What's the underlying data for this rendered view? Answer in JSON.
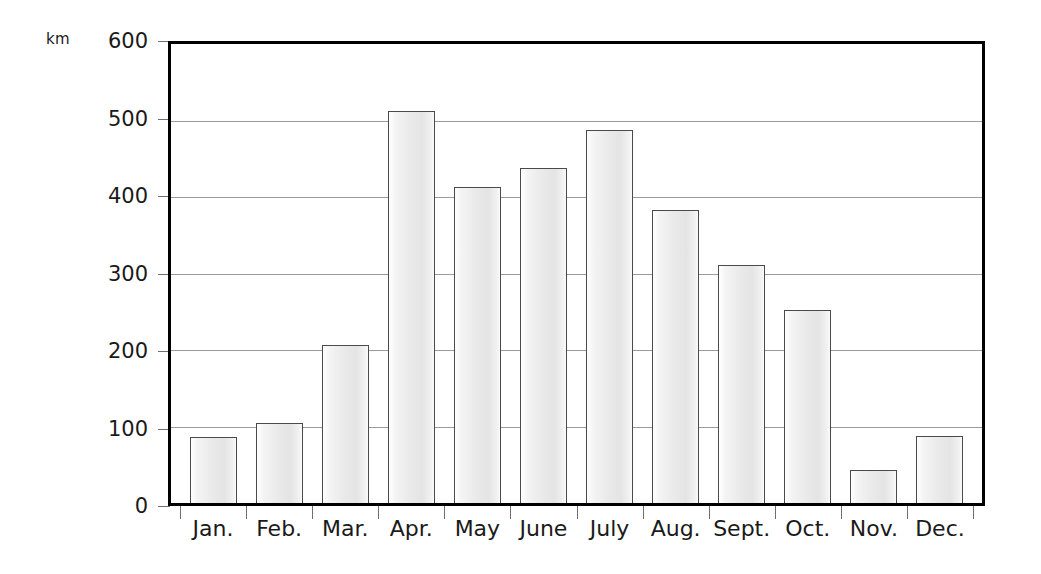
{
  "chart_data": {
    "type": "bar",
    "title": "",
    "subtitle": "",
    "xlabel": "",
    "ylabel": "km",
    "unit_label": "km",
    "categories": [
      "Jan.",
      "Feb.",
      "Mar.",
      "Apr.",
      "May",
      "June",
      "July",
      "Aug.",
      "Sept.",
      "Oct.",
      "Nov.",
      "Dec."
    ],
    "values": [
      86,
      105,
      207,
      512,
      413,
      438,
      488,
      383,
      311,
      252,
      43,
      88
    ],
    "series": [
      {
        "name": "",
        "values": [
          86,
          105,
          207,
          512,
          413,
          438,
          488,
          383,
          311,
          252,
          43,
          88
        ]
      }
    ],
    "ylim": [
      0,
      600
    ],
    "ytick_labels": [
      "0",
      "100",
      "200",
      "300",
      "400",
      "500",
      "600"
    ],
    "ytick_values": [
      0,
      100,
      200,
      300,
      400,
      500,
      600
    ],
    "grid": true,
    "grid_axis": "y",
    "legend": false,
    "legend_position": "none",
    "annotations": [],
    "colors": {
      "bar_fill": "#ebebeb",
      "bar_border": "#4a4a4a",
      "gridline": "#9a9a9a",
      "frame": "#000000",
      "text": "#1a1a1a",
      "background": "#ffffff"
    }
  }
}
